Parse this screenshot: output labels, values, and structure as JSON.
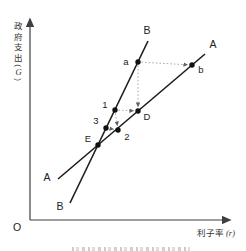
{
  "figure": {
    "y_axis_label": "政府支出",
    "y_axis_unit": "(G)",
    "x_axis_label": "利子率",
    "x_axis_unit": "(r)",
    "origin_label": "O"
  },
  "chart_data": {
    "type": "line",
    "title": "",
    "xlabel": "利子率 (r)",
    "ylabel": "政府支出 (G)",
    "axis_numeric": false,
    "grid": false,
    "legend": "none",
    "lines": [
      {
        "name": "A",
        "label": "A",
        "x1": 58,
        "y1": 179,
        "x2": 205,
        "y2": 54,
        "label_start": {
          "x": 47,
          "y": 181
        },
        "label_end": {
          "x": 213,
          "y": 48
        }
      },
      {
        "name": "B",
        "label": "B",
        "x1": 70,
        "y1": 203,
        "x2": 148,
        "y2": 41,
        "label_start": {
          "x": 60,
          "y": 210
        },
        "label_end": {
          "x": 147,
          "y": 34
        }
      }
    ],
    "points": [
      {
        "name": "E",
        "label": "E",
        "x": 98,
        "y": 145,
        "label_x": 88,
        "label_y": 142
      },
      {
        "name": "3",
        "label": "3",
        "x": 106,
        "y": 128,
        "label_x": 96,
        "label_y": 124
      },
      {
        "name": "2",
        "label": "2",
        "x": 118,
        "y": 130,
        "label_x": 127,
        "label_y": 140
      },
      {
        "name": "1",
        "label": "1",
        "x": 115,
        "y": 110,
        "label_x": 105,
        "label_y": 108
      },
      {
        "name": "D",
        "label": "D",
        "x": 138,
        "y": 111,
        "label_x": 147,
        "label_y": 120
      },
      {
        "name": "a",
        "label": "a",
        "x": 138,
        "y": 62,
        "label_x": 126,
        "label_y": 65
      },
      {
        "name": "b",
        "label": "b",
        "x": 192,
        "y": 65,
        "label_x": 201,
        "label_y": 73
      }
    ],
    "connectors": [
      {
        "from": "a",
        "to": "b"
      },
      {
        "from": "a",
        "to": "D"
      },
      {
        "from": "1",
        "to": "D"
      },
      {
        "from": "1",
        "to": "2"
      },
      {
        "from": "3",
        "to": "2"
      }
    ]
  }
}
